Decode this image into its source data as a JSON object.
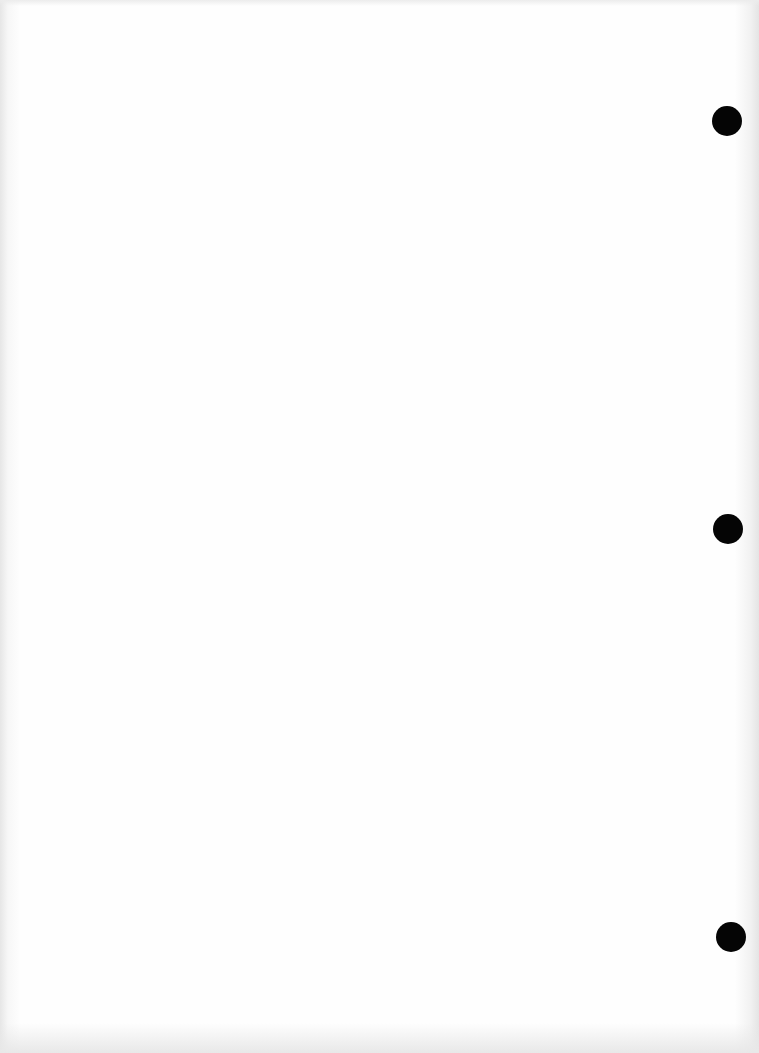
{
  "document": {
    "type": "blank scanned page",
    "text": "",
    "punch_holes": [
      {
        "x": 712,
        "y": 106
      },
      {
        "x": 713,
        "y": 514
      },
      {
        "x": 716,
        "y": 922
      }
    ],
    "colors": {
      "paper": "#fefefe",
      "hole": "#050505"
    }
  }
}
